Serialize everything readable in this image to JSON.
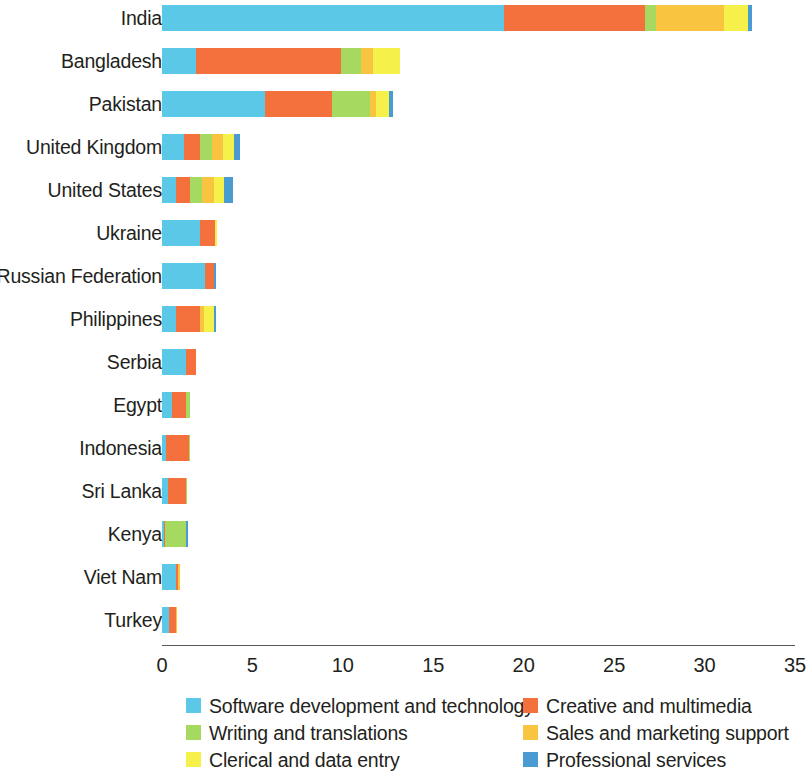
{
  "chart_data": {
    "type": "bar",
    "orientation": "horizontal",
    "stacked": true,
    "title": "",
    "subtitle": "",
    "xlabel": "",
    "ylabel": "",
    "xlim": [
      0,
      35
    ],
    "xticks": [
      0,
      5,
      10,
      15,
      20,
      25,
      30,
      35
    ],
    "xtick_labels": [
      "0",
      "5",
      "10",
      "15",
      "20",
      "25",
      "30",
      "35"
    ],
    "grid": false,
    "legend_position": "bottom",
    "categories": [
      "India",
      "Bangladesh",
      "Pakistan",
      "United Kingdom",
      "United States",
      "Ukraine",
      "Russian Federation",
      "Philippines",
      "Serbia",
      "Egypt",
      "Indonesia",
      "Sri Lanka",
      "Kenya",
      "Viet Nam",
      "Turkey"
    ],
    "series": [
      {
        "name": "Software development and technology",
        "color": "#5BC8E8",
        "values": [
          18.9,
          1.9,
          5.7,
          1.2,
          0.8,
          2.1,
          2.4,
          0.8,
          1.35,
          0.55,
          0.2,
          0.35,
          0.1,
          0.75,
          0.4
        ]
      },
      {
        "name": "Creative and multimedia",
        "color": "#F4703C",
        "values": [
          7.8,
          8.0,
          3.7,
          0.9,
          0.75,
          0.85,
          0.45,
          1.3,
          0.55,
          0.8,
          1.3,
          1.0,
          0.05,
          0.15,
          0.35
        ]
      },
      {
        "name": "Writing and translations",
        "color": "#A5D960",
        "values": [
          0.6,
          1.1,
          2.1,
          0.65,
          0.65,
          0.0,
          0.0,
          0.0,
          0.0,
          0.2,
          0.05,
          0.05,
          1.2,
          0.0,
          0.0
        ]
      },
      {
        "name": "Sales and marketing support",
        "color": "#F9C440",
        "values": [
          3.8,
          0.65,
          0.35,
          0.65,
          0.65,
          0.0,
          0.0,
          0.2,
          0.0,
          0.0,
          0.0,
          0.0,
          0.0,
          0.1,
          0.05
        ]
      },
      {
        "name": "Clerical and data entry",
        "color": "#F5F04A",
        "values": [
          1.3,
          1.5,
          0.7,
          0.6,
          0.6,
          0.1,
          0.0,
          0.55,
          0.0,
          0.0,
          0.0,
          0.0,
          0.0,
          0.0,
          0.0
        ]
      },
      {
        "name": "Professional services",
        "color": "#4A9BD1",
        "values": [
          0.2,
          0.0,
          0.2,
          0.3,
          0.5,
          0.0,
          0.15,
          0.15,
          0.0,
          0.0,
          0.0,
          0.0,
          0.1,
          0.0,
          0.0
        ]
      }
    ],
    "totals": [
      32.6,
      13.15,
      12.75,
      4.3,
      3.95,
      3.05,
      3.0,
      3.0,
      1.9,
      1.55,
      1.55,
      1.4,
      1.45,
      1.0,
      0.8
    ]
  },
  "legend": {
    "items": [
      {
        "label": "Software development and technology",
        "color": "#5BC8E8"
      },
      {
        "label": "Creative and multimedia",
        "color": "#F4703C"
      },
      {
        "label": "Writing and translations",
        "color": "#A5D960"
      },
      {
        "label": "Sales and marketing support",
        "color": "#F9C440"
      },
      {
        "label": "Clerical and data entry",
        "color": "#F5F04A"
      },
      {
        "label": "Professional services",
        "color": "#4A9BD1"
      }
    ]
  },
  "axis": {
    "line_color": "#58595b",
    "labels": [
      "0",
      "5",
      "10",
      "15",
      "20",
      "25",
      "30",
      "35"
    ]
  }
}
